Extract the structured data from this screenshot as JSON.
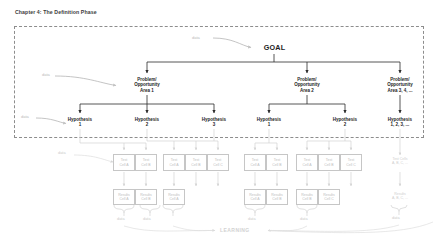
{
  "page": {
    "title": "Chapter 4: The Definition Phase",
    "background": "#ffffff",
    "dark_ink": "#1d1d1d",
    "light_ink": "#c6c6c6",
    "border_dashed": "#8d8d8d"
  },
  "diagram": {
    "goal": {
      "label": "GOAL"
    },
    "problems": [
      {
        "l1": "Problem/",
        "l2": "Opportunity",
        "l3": "Area 1"
      },
      {
        "l1": "Problem/",
        "l2": "Opportunity",
        "l3": "Area 2"
      },
      {
        "l1": "Problem/",
        "l2": "Opportunity",
        "l3": "Area 3, 4, ..."
      }
    ],
    "hypotheses": [
      {
        "l1": "Hypothesis",
        "l2": "1"
      },
      {
        "l1": "Hypothesis",
        "l2": "2"
      },
      {
        "l1": "Hypothesis",
        "l2": "3"
      },
      {
        "l1": "Hypothesis",
        "l2": "1"
      },
      {
        "l1": "Hypothesis",
        "l2": "2"
      },
      {
        "l1": "Hypothesis",
        "l2": "1, 2, 3, ..."
      }
    ],
    "test_cells": [
      {
        "l1": "Test",
        "l2": "Cell A"
      },
      {
        "l1": "Test",
        "l2": "Cell B"
      },
      {
        "l1": "Test",
        "l2": "Cell A"
      },
      {
        "l1": "Test",
        "l2": "Cell B"
      },
      {
        "l1": "Test",
        "l2": "Cell C"
      },
      {
        "l1": "Test",
        "l2": "Cell A"
      },
      {
        "l1": "Test",
        "l2": "Cell B"
      },
      {
        "l1": "Test",
        "l2": "Cell A"
      },
      {
        "l1": "Test",
        "l2": "Cell B"
      },
      {
        "l1": "Test",
        "l2": "Cell C"
      }
    ],
    "test_cells_overflow": {
      "l1": "Test Cells",
      "l2": "A, B, C, ..."
    },
    "results": [
      {
        "l1": "Results",
        "l2": "Cell A"
      },
      {
        "l1": "Results",
        "l2": "Cell B"
      },
      {
        "l1": "Results",
        "l2": "Cell A"
      },
      {
        "l1": "Results",
        "l2": "Cell A"
      },
      {
        "l1": "Results",
        "l2": "Cell B"
      },
      {
        "l1": "Results",
        "l2": "Cell B"
      },
      {
        "l1": "Results",
        "l2": "Cell C"
      }
    ],
    "results_overflow": {
      "l1": "Results",
      "l2": "A, B, C, ..."
    },
    "learning": {
      "label": "LEARNING"
    },
    "data_labels": {
      "goal_in": "data",
      "po_left": "data",
      "hyp_left": "data",
      "test_left": "data",
      "brace_1": "data",
      "brace_2": "data",
      "brace_3": "data",
      "brace_4": "data",
      "brace_5": "data"
    }
  }
}
